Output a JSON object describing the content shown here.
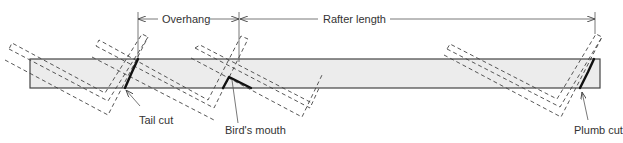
{
  "diagram": {
    "dimensions": [
      {
        "id": "overhang",
        "label": "Overhang"
      },
      {
        "id": "rafter-length",
        "label": "Rafter length"
      }
    ],
    "callouts": [
      {
        "id": "tail-cut",
        "label": "Tail cut"
      },
      {
        "id": "birds-mouth",
        "label": "Bird's mouth"
      },
      {
        "id": "plumb-cut",
        "label": "Plumb cut"
      }
    ],
    "colors": {
      "board_fill": "#ececec",
      "board_stroke": "#444444",
      "cut_stroke": "#111111",
      "square_stroke": "#444444"
    }
  }
}
